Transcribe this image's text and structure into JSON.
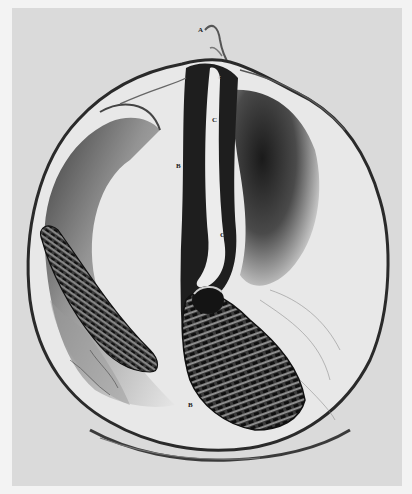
{
  "figure": {
    "colors": {
      "margin": "#f3f3f3",
      "plate": "#dadada",
      "ink_dark": "#1a1a1a",
      "ink_mid": "#5a5a5a",
      "highlight": "#efefef"
    },
    "labels": [
      {
        "id": "A",
        "text": "A",
        "x": 198,
        "y": 27
      },
      {
        "id": "c",
        "text": "c",
        "x": 218,
        "y": 74
      },
      {
        "id": "C-upper",
        "text": "C",
        "x": 212,
        "y": 117
      },
      {
        "id": "B-upper",
        "text": "B",
        "x": 176,
        "y": 163
      },
      {
        "id": "C-lower",
        "text": "C",
        "x": 220,
        "y": 232
      },
      {
        "id": "B-lower",
        "text": "B",
        "x": 188,
        "y": 402
      }
    ]
  }
}
